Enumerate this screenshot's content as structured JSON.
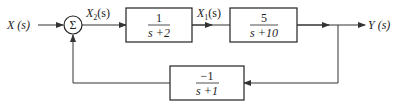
{
  "diagram": {
    "type": "control-system-block-diagram",
    "input": {
      "label": "X (s)"
    },
    "summing_junction": {
      "symbol": "Σ"
    },
    "signals": {
      "x2": {
        "label_main": "X",
        "label_sub": "2",
        "label_arg": "(s)"
      },
      "x1": {
        "label_main": "X",
        "label_sub": "1",
        "label_arg": "(s)"
      }
    },
    "output": {
      "label": "Y (s)"
    },
    "blocks": {
      "forward1": {
        "numerator": "1",
        "denominator": "s +2"
      },
      "forward2": {
        "numerator": "5",
        "denominator": "s +10"
      },
      "feedback": {
        "numerator": "−1",
        "denominator": "s +1"
      }
    },
    "colors": {
      "line": "#333333",
      "box_border": "#222222",
      "background": "#ffffff"
    }
  }
}
